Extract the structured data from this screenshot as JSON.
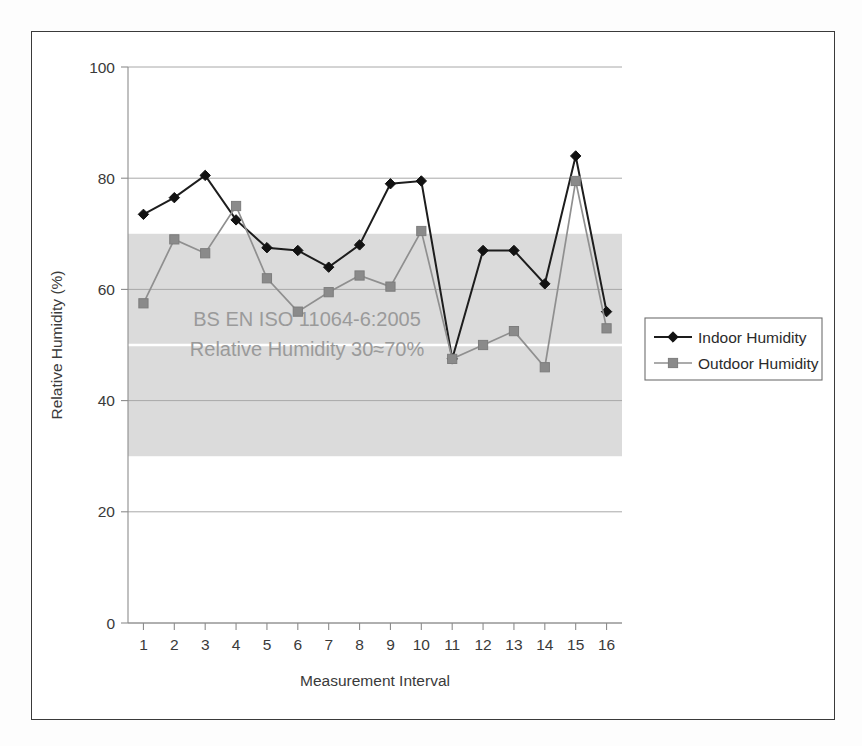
{
  "chart_data": {
    "type": "line",
    "title": "",
    "xlabel": "Measurement Interval",
    "ylabel": "Relative Humidity (%)",
    "x": [
      1,
      2,
      3,
      4,
      5,
      6,
      7,
      8,
      9,
      10,
      11,
      12,
      13,
      14,
      15,
      16
    ],
    "xtick_labels": [
      "1",
      "2",
      "3",
      "4",
      "5",
      "6",
      "7",
      "8",
      "9",
      "10",
      "11",
      "12",
      "13",
      "14",
      "15",
      "16"
    ],
    "ytick_labels": [
      "0",
      "20",
      "40",
      "60",
      "80",
      "100"
    ],
    "yticks": [
      0,
      20,
      40,
      60,
      80,
      100
    ],
    "ylim": [
      0,
      100
    ],
    "xlim": [
      0.5,
      16.5
    ],
    "grid": "horizontal",
    "legend_position": "right",
    "series": [
      {
        "name": "Indoor Humidity",
        "marker": "diamond",
        "color": "#121212",
        "values": [
          73.5,
          76.5,
          80.5,
          72.5,
          67.5,
          67,
          64,
          68,
          79,
          79.5,
          47.5,
          67,
          67,
          61,
          84,
          56
        ]
      },
      {
        "name": "Outdoor Humidity",
        "marker": "square",
        "color": "#8a8a8a",
        "values": [
          57.5,
          69,
          66.5,
          75,
          62,
          56,
          59.5,
          62.5,
          60.5,
          70.5,
          47.5,
          50,
          52.5,
          46,
          79.5,
          53
        ]
      }
    ],
    "shaded_band": {
      "label": "comfort-zone",
      "y_min": 30,
      "y_max": 70,
      "color": "#d9d9d9",
      "split_line_y": 50
    },
    "annotations": [
      {
        "text": "BS EN ISO 11064-6:2005",
        "x": 6.3,
        "y": 53.5
      },
      {
        "text": "Relative Humidity 30≈70%",
        "x": 6.3,
        "y": 48.0
      }
    ]
  },
  "legend": {
    "items": [
      {
        "label": "Indoor Humidity",
        "marker": "diamond",
        "color": "#121212"
      },
      {
        "label": "Outdoor Humidity",
        "marker": "square",
        "color": "#8a8a8a"
      }
    ]
  }
}
